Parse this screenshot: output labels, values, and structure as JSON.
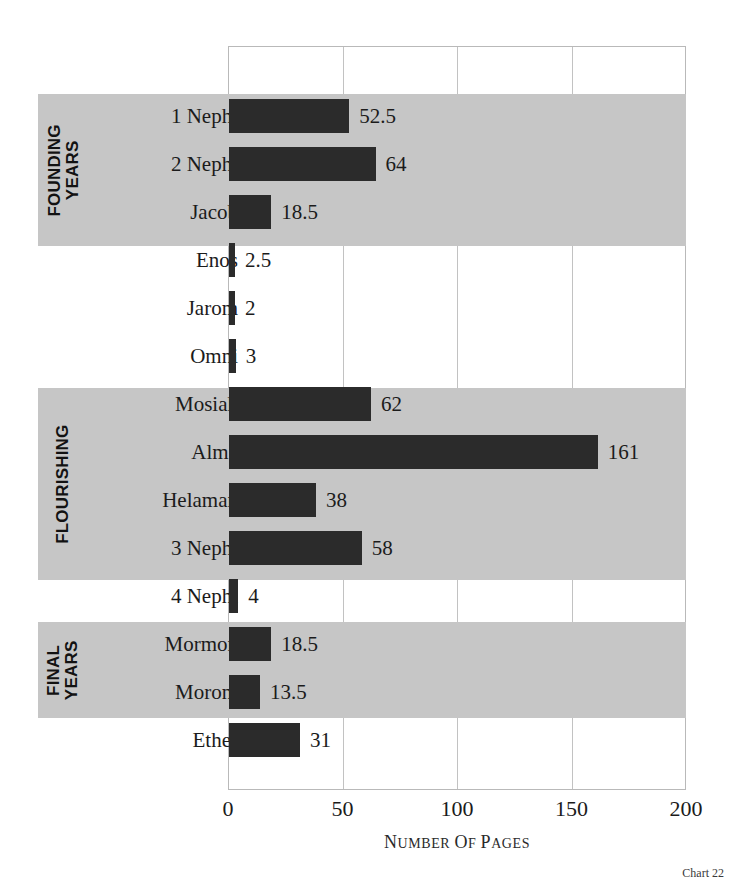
{
  "chart_data": {
    "type": "bar",
    "orientation": "horizontal",
    "title": "",
    "xlabel": "Number of Pages",
    "ylabel": "",
    "xlim": [
      0,
      200
    ],
    "xticks": [
      0,
      50,
      100,
      150,
      200
    ],
    "xtick_labels": [
      "0",
      "50",
      "100",
      "150",
      "200"
    ],
    "grid": true,
    "legend": false,
    "categories": [
      "1 Nephi",
      "2 Nephi",
      "Jacob",
      "Enos",
      "Jarom",
      "Omni",
      "Mosiah",
      "Alma",
      "Helaman",
      "3 Nephi",
      "4 Nephi",
      "Mormon",
      "Moroni",
      "Ether"
    ],
    "values": [
      52.5,
      64,
      18.5,
      2.5,
      2,
      3,
      62,
      161,
      38,
      58,
      4,
      18.5,
      13.5,
      31
    ],
    "value_labels": [
      "52.5",
      "64",
      "18.5",
      "2.5",
      "2",
      "3",
      "62",
      "161",
      "38",
      "58",
      "4",
      "18.5",
      "13.5",
      "31"
    ],
    "bar_color": "#2b2b2b",
    "band_color": "#c6c6c6",
    "groups": [
      {
        "label_lines": [
          "FOUNDING",
          "YEARS"
        ],
        "start_index": 0,
        "end_index": 2
      },
      {
        "label_lines": [
          "FLOURISHING"
        ],
        "start_index": 6,
        "end_index": 9
      },
      {
        "label_lines": [
          "FINAL",
          "YEARS"
        ],
        "start_index": 11,
        "end_index": 12
      }
    ],
    "caption": "Chart 22"
  },
  "axis": {
    "title_small_caps": "NUMBER OF PAGES",
    "title_display": "N<span>UMBER OF</span> P<span>AGES</span>"
  },
  "figure": {
    "caption": "Chart 22"
  }
}
